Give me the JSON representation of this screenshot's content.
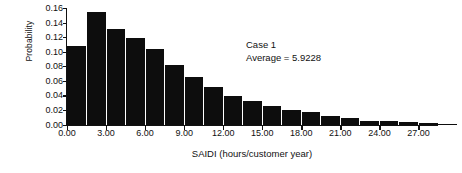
{
  "chart_data": {
    "type": "bar",
    "title": "",
    "xlabel": "SAIDI (hours/customer year)",
    "ylabel": "Probability",
    "ylim": [
      0.0,
      0.16
    ],
    "xlim": [
      0.0,
      28.5
    ],
    "grid": false,
    "legend": null,
    "bar_width_hours": 1.425,
    "categories": [
      "0.00",
      "1.50",
      "3.00",
      "4.50",
      "6.00",
      "7.50",
      "9.00",
      "10.50",
      "12.00",
      "13.50",
      "15.00",
      "16.50",
      "18.00",
      "19.50",
      "21.00",
      "22.50",
      "24.00",
      "25.50",
      "27.00",
      "28.50"
    ],
    "x": [
      0.75,
      2.25,
      3.75,
      5.25,
      6.75,
      8.25,
      9.75,
      11.25,
      12.75,
      14.25,
      15.75,
      17.25,
      18.75,
      20.25,
      21.75,
      23.25,
      24.75,
      26.25,
      27.75,
      29.25
    ],
    "values": [
      0.108,
      0.155,
      0.131,
      0.119,
      0.104,
      0.082,
      0.066,
      0.052,
      0.039,
      0.033,
      0.025,
      0.02,
      0.017,
      0.012,
      0.009,
      0.005,
      0.005,
      0.003,
      0.002,
      0.001
    ],
    "ytick_labels": [
      "0.00",
      "0.02",
      "0.04",
      "0.06",
      "0.08",
      "0.10",
      "0.12",
      "0.14",
      "0.16"
    ],
    "ytick_values": [
      0.0,
      0.02,
      0.04,
      0.06,
      0.08,
      0.1,
      0.12,
      0.14,
      0.16
    ],
    "xtick_labels": [
      "0.00",
      "3.00",
      "6.00",
      "9.00",
      "12.00",
      "15.00",
      "18.00",
      "21.00",
      "24.00",
      "27.00"
    ],
    "xtick_values": [
      0.0,
      3.0,
      6.0,
      9.0,
      12.0,
      15.0,
      18.0,
      21.0,
      24.0,
      27.0
    ],
    "annotations": [
      {
        "text": "Case 1"
      },
      {
        "text": "Average = 5.9228"
      }
    ],
    "colors": {
      "bar": "#0d0d0d",
      "axis": "#111111",
      "background": "#ffffff"
    }
  }
}
